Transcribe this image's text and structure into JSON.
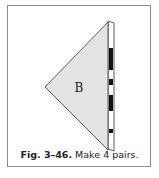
{
  "figure": {
    "piece_label": "B",
    "caption_number": "Fig. 3–46.",
    "caption_text": " Make 4 pairs.",
    "colors": {
      "fill": "#e3e3e3",
      "stroke": "#333333",
      "frame": "#8a8a8a"
    }
  }
}
